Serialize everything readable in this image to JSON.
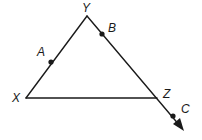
{
  "diagram": {
    "type": "geometry-triangle",
    "stroke_color": "#1a1a1a",
    "background": "#ffffff",
    "vertices": [
      {
        "label": "X",
        "x": 26,
        "y": 98
      },
      {
        "label": "Y",
        "x": 87,
        "y": 16
      },
      {
        "label": "Z",
        "x": 157,
        "y": 98
      }
    ],
    "points_on_segments": [
      {
        "label": "A",
        "segment": "XY",
        "x": 51,
        "y": 62
      },
      {
        "label": "B",
        "segment": "YZ",
        "x": 102,
        "y": 34
      },
      {
        "label": "C",
        "segment": "ray YZ beyond Z",
        "x": 173,
        "y": 116
      }
    ],
    "ray": {
      "from": "Y",
      "through": "Z",
      "arrow_tip": {
        "x": 183,
        "y": 130
      }
    },
    "labels": {
      "X": "X",
      "Y": "Y",
      "Z": "Z",
      "A": "A",
      "B": "B",
      "C": "C"
    }
  }
}
